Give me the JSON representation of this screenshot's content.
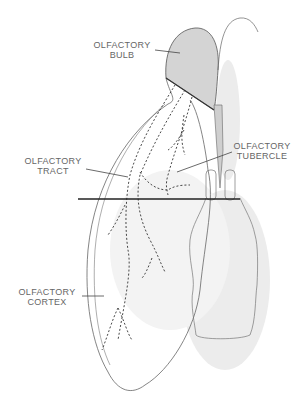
{
  "labels": {
    "bulb": [
      "OLFACTORY",
      "BULB"
    ],
    "tract": [
      "OLFACTORY",
      "TRACT"
    ],
    "tubercle": [
      "OLFACTORY",
      "TUBERCLE"
    ],
    "cortex": [
      "OLFACTORY",
      "CORTEX"
    ]
  },
  "colors": {
    "stroke": "#555555",
    "bulb_fill": "#d4d4d4",
    "stipple": "#e6e6e6",
    "section_line": "#222222"
  }
}
